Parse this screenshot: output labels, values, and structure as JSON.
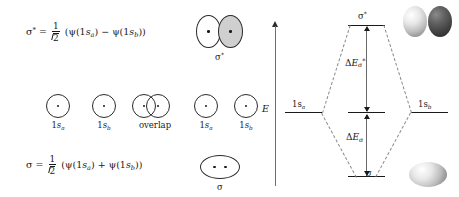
{
  "figure": {
    "background": "#ffffff"
  },
  "equations": {
    "antibonding": {
      "lhs": "σ",
      "lhs_sup": "*",
      "equals": "=",
      "frac_num": "1",
      "frac_den_radicand": "2",
      "open_paren": "(",
      "psi1": "ψ(1",
      "psi1_orb": "s",
      "psi1_sub": "a",
      "psi1_close": ")",
      "operator": "−",
      "psi2": "ψ(1",
      "psi2_orb": "s",
      "psi2_sub": "b",
      "psi2_close": ")",
      "close_paren": ")"
    },
    "bonding": {
      "lhs": "σ",
      "lhs_sup": "",
      "equals": "=",
      "frac_num": "1",
      "frac_den_radicand": "2",
      "open_paren": "(",
      "psi1": "ψ(1",
      "psi1_orb": "s",
      "psi1_sub": "a",
      "psi1_close": ")",
      "operator": "+",
      "psi2": "ψ(1",
      "psi2_orb": "s",
      "psi2_sub": "b",
      "psi2_close": ")",
      "close_paren": ")"
    }
  },
  "atomic_orbitals_row": [
    {
      "name": "1s-a-orbital",
      "prefix": "1",
      "orb": "s",
      "sub": "a",
      "kind": "circle"
    },
    {
      "name": "1s-b-orbital",
      "prefix": "1",
      "orb": "s",
      "sub": "b",
      "kind": "circle"
    },
    {
      "name": "overlap-orbitals",
      "label": "overlap",
      "kind": "overlap"
    }
  ],
  "combination_column": {
    "sigma_star": {
      "label": "σ",
      "label_sup": "*",
      "left_lobe_phase": "plain",
      "right_lobe_phase": "shaded"
    },
    "atomic_pair": [
      {
        "name": "1s-a-orbital-mid",
        "prefix": "1",
        "orb": "s",
        "sub": "a"
      },
      {
        "name": "1s-b-orbital-mid",
        "prefix": "1",
        "orb": "s",
        "sub": "b"
      }
    ],
    "sigma": {
      "label": "σ",
      "label_sup": ""
    }
  },
  "energy_diagram": {
    "axis_label": "E",
    "levels": {
      "left_atomic": {
        "prefix": "1",
        "orb": "s",
        "sub": "a"
      },
      "right_atomic": {
        "prefix": "1",
        "orb": "s",
        "sub": "b"
      },
      "antibonding": {
        "label": "σ",
        "label_sup": "*"
      },
      "bonding": {
        "label": "σ",
        "label_sup": ""
      }
    },
    "gaps": {
      "antibonding": {
        "delta": "Δ",
        "e": "E",
        "sub": "σ",
        "sub_sup": "*"
      },
      "bonding": {
        "delta": "Δ",
        "e": "E",
        "sub": "σ",
        "sub_sup": ""
      }
    }
  },
  "rendered_orbitals": {
    "antibonding_pair": [
      {
        "name": "sigma-star-lobe-light",
        "shade": "light"
      },
      {
        "name": "sigma-star-lobe-dark",
        "shade": "dark"
      }
    ],
    "bonding_blob": {
      "name": "sigma-bonding-blob",
      "shade": "light"
    }
  },
  "colors": {
    "ink": "#1a1a1a",
    "stroke": "#2b2b2b",
    "dashed": "#8a8a8a",
    "axis": "#6e6e6e",
    "shaded_lobe": "#cfcfcf"
  }
}
